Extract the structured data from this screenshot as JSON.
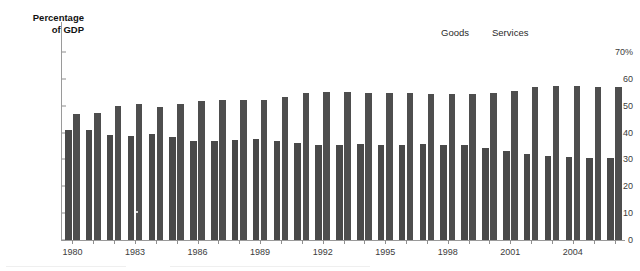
{
  "chart_data": {
    "type": "bar",
    "title": "",
    "subtitle": "",
    "xlabel": "",
    "ylabel": "Percentage\nof GDP",
    "ylim": [
      0,
      70
    ],
    "yticks": [
      0,
      10,
      20,
      30,
      40,
      50,
      60,
      70
    ],
    "ytick_labels": [
      "0",
      "10",
      "20",
      "30",
      "40",
      "50",
      "60",
      "70%"
    ],
    "grid": false,
    "legend_position": "top-right",
    "categories": [
      "1980",
      "1981",
      "1982",
      "1983",
      "1984",
      "1985",
      "1986",
      "1987",
      "1988",
      "1989",
      "1990",
      "1991",
      "1992",
      "1993",
      "1994",
      "1995",
      "1996",
      "1997",
      "1998",
      "1999",
      "2000",
      "2001",
      "2002",
      "2003",
      "2004",
      "2005",
      "2006"
    ],
    "xtick_labels": [
      "1980",
      "1983",
      "1986",
      "1989",
      "1992",
      "1995",
      "1998",
      "2001",
      "2004"
    ],
    "series": [
      {
        "name": "Goods",
        "color": "#494949",
        "values": [
          41.0,
          41.1,
          39.0,
          38.6,
          39.4,
          38.2,
          36.9,
          36.9,
          37.2,
          37.6,
          36.8,
          36.3,
          35.5,
          35.4,
          35.8,
          35.4,
          35.2,
          35.7,
          35.2,
          35.2,
          34.3,
          33.2,
          32.2,
          31.4,
          31.0,
          30.6,
          30.7
        ]
      },
      {
        "name": "Services",
        "color": "#4e4e4e",
        "values": [
          47.0,
          47.4,
          49.8,
          50.7,
          49.4,
          50.6,
          51.8,
          52.1,
          52.1,
          52.0,
          53.2,
          54.7,
          55.2,
          55.2,
          54.8,
          54.8,
          54.8,
          54.4,
          54.3,
          54.3,
          54.7,
          55.6,
          57.1,
          57.4,
          57.3,
          57.0,
          57.1
        ]
      }
    ]
  },
  "legend": {
    "items": [
      {
        "label": "Goods"
      },
      {
        "label": "Services"
      }
    ]
  },
  "axis": {
    "title": "Percentage\nof GDP"
  }
}
